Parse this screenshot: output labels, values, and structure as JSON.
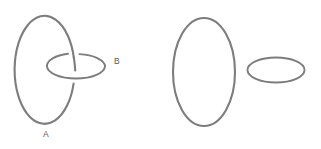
{
  "figure": {
    "background_color": "#ffffff",
    "stroke_color": "#7d7d7d",
    "label_color": "#5a5a5a",
    "width": 321,
    "height": 149
  },
  "left_figure": {
    "name": "linked-rings",
    "description": "Two interlocking circles forming a Hopf link",
    "vertical_ring": {
      "label": "A",
      "label_x": 46,
      "label_y": 137,
      "center_x": 50,
      "center_y": 71,
      "radius_x": 30,
      "radius_y": 54
    },
    "horizontal_ring": {
      "label": "B",
      "label_x": 114,
      "label_y": 64,
      "center_x": 76,
      "center_y": 66,
      "radius_x": 29,
      "radius_y": 12.5
    },
    "crossing": {
      "far_arc_broken_by": "vertical-ring",
      "near_arc_breaks": "vertical-ring"
    }
  },
  "right_figure": {
    "name": "unlinked-rings",
    "description": "Two separate circles that are not linked",
    "vertical_ring": {
      "label": "",
      "center_x": 204,
      "center_y": 72,
      "radius_x": 31,
      "radius_y": 54
    },
    "horizontal_ring": {
      "label": "",
      "center_x": 276,
      "center_y": 70,
      "radius_x": 28.5,
      "radius_y": 12.5
    }
  },
  "labels": {
    "a": "A",
    "b": "B"
  }
}
